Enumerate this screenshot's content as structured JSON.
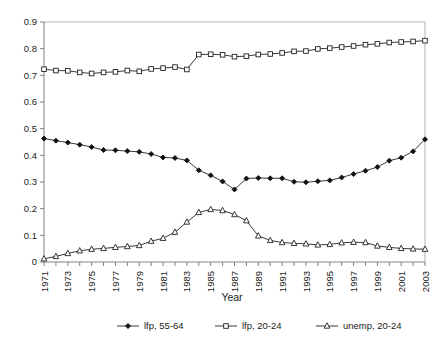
{
  "chart_data": {
    "type": "line",
    "title": "",
    "xlabel": "Year",
    "ylabel": "",
    "x": [
      1971,
      1972,
      1973,
      1974,
      1975,
      1976,
      1977,
      1978,
      1979,
      1980,
      1981,
      1982,
      1983,
      1984,
      1985,
      1986,
      1987,
      1988,
      1989,
      1990,
      1991,
      1992,
      1993,
      1994,
      1995,
      1996,
      1997,
      1998,
      1999,
      2000,
      2001,
      2002,
      2003
    ],
    "xlim": [
      1971,
      2003
    ],
    "ylim": [
      0,
      0.9
    ],
    "ytick_labels": [
      "0.9",
      "0.8",
      "0.7",
      "0.6",
      "0.5",
      "0.4",
      "0.3",
      "0.2",
      "0.1",
      "0"
    ],
    "ytick_values": [
      0.9,
      0.8,
      0.7,
      0.6,
      0.5,
      0.4,
      0.3,
      0.2,
      0.1,
      0
    ],
    "xtick_labels": [
      "1971",
      "1973",
      "1975",
      "1977",
      "1979",
      "1981",
      "1983",
      "1985",
      "1987",
      "1989",
      "1991",
      "1993",
      "1995",
      "1997",
      "1999",
      "2001",
      "2003"
    ],
    "xtick_values": [
      1971,
      1973,
      1975,
      1977,
      1979,
      1981,
      1983,
      1985,
      1987,
      1989,
      1991,
      1993,
      1995,
      1997,
      1999,
      2001,
      2003
    ],
    "grid": false,
    "legend_position": "bottom",
    "series": [
      {
        "name": "lfp, 55-64",
        "marker": "filled-diamond",
        "color": "#111111",
        "values": [
          0.463,
          0.455,
          0.448,
          0.44,
          0.431,
          0.42,
          0.419,
          0.416,
          0.413,
          0.405,
          0.392,
          0.39,
          0.381,
          0.344,
          0.325,
          0.302,
          0.272,
          0.313,
          0.315,
          0.314,
          0.314,
          0.301,
          0.299,
          0.303,
          0.306,
          0.317,
          0.33,
          0.342,
          0.356,
          0.38,
          0.391,
          0.415,
          0.46
        ]
      },
      {
        "name": "lfp, 20-24",
        "marker": "open-square",
        "color": "#222222",
        "values": [
          0.723,
          0.718,
          0.717,
          0.711,
          0.707,
          0.711,
          0.713,
          0.718,
          0.715,
          0.724,
          0.727,
          0.731,
          0.722,
          0.778,
          0.779,
          0.777,
          0.77,
          0.772,
          0.778,
          0.78,
          0.784,
          0.79,
          0.791,
          0.799,
          0.802,
          0.806,
          0.81,
          0.815,
          0.818,
          0.823,
          0.825,
          0.827,
          0.83
        ]
      },
      {
        "name": "unemp, 20-24",
        "marker": "open-triangle",
        "color": "#222222",
        "values": [
          0.012,
          0.021,
          0.032,
          0.042,
          0.048,
          0.051,
          0.055,
          0.058,
          0.062,
          0.078,
          0.089,
          0.112,
          0.15,
          0.186,
          0.197,
          0.193,
          0.178,
          0.155,
          0.098,
          0.081,
          0.073,
          0.07,
          0.068,
          0.064,
          0.066,
          0.072,
          0.074,
          0.073,
          0.06,
          0.055,
          0.051,
          0.049,
          0.048
        ]
      }
    ]
  },
  "legend": {
    "items": [
      {
        "label": "lfp, 55-64",
        "marker": "filled-diamond"
      },
      {
        "label": "lfp, 20-24",
        "marker": "open-square"
      },
      {
        "label": "unemp, 20-24",
        "marker": "open-triangle"
      }
    ]
  },
  "axes": {
    "x_title": "Year"
  }
}
